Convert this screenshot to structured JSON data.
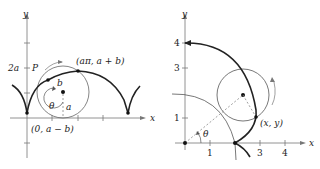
{
  "left_figure": {
    "axis_x_label": "x",
    "axis_y_label": "y",
    "y_tick_label": "2a",
    "point_P_label": "P",
    "top_point_label": "(aπ,  a + b)",
    "bottom_point_label": "(0, a − b)",
    "radius_b_label": "b",
    "radius_a_label": "a",
    "angle_label": "θ"
  },
  "right_figure": {
    "axis_x_label": "x",
    "axis_y_label": "y",
    "x_tick_labels": [
      "1",
      "3",
      "4"
    ],
    "y_tick_labels": [
      "1",
      "3",
      "4"
    ],
    "point_label": "(x, y)",
    "angle_label": "θ"
  },
  "colors": {
    "curve": "#222222",
    "thin": "#555555",
    "dashed": "#888888"
  }
}
